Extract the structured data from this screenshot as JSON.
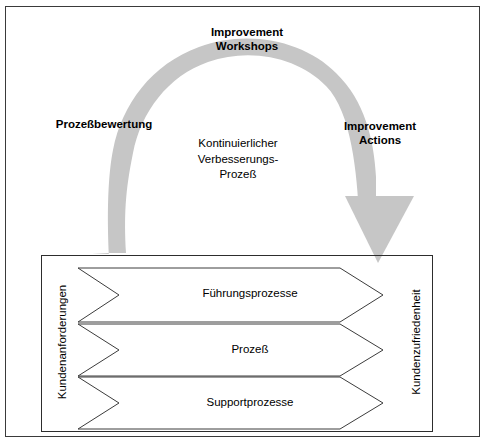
{
  "diagram": {
    "title_text_present": false,
    "colors": {
      "arc_gray": "#c6c6c6",
      "frame_border": "#3a3a3a",
      "inner_border": "#2d2d2d",
      "chevron_stroke": "#3c3c3c",
      "chevron_fill": "#ffffff",
      "text": "#000000",
      "background": "#ffffff"
    },
    "cycle": {
      "top_label": "Improvement\nWorkshops",
      "top_label_line1": "Improvement",
      "top_label_line2": "Workshops",
      "left_label": "Prozeßbewertung",
      "right_label_line1": "Improvement",
      "right_label_line2": "Actions",
      "center_line1": "Kontinuierlicher",
      "center_line2": "Verbesserungs-",
      "center_line3": "Prozeß",
      "arrow_direction": "clockwise",
      "arrow_head": "down-arrow-head"
    },
    "process_box": {
      "left_label": "Kundenanforderungen",
      "right_label": "Kundenzufriedenheit",
      "chevrons": [
        {
          "label": "Führungsprozesse"
        },
        {
          "label": "Prozeß"
        },
        {
          "label": "Supportprozesse"
        }
      ]
    }
  }
}
